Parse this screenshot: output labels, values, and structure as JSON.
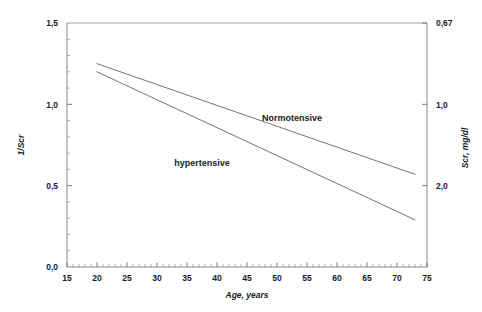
{
  "chart_data": {
    "type": "line",
    "title": "",
    "subtitle": "",
    "xlabel": "Age, years",
    "ylabel": "1/Scr",
    "ylabel_right": "Scr, mg/dl",
    "xlim": [
      15,
      75
    ],
    "ylim": [
      0.0,
      1.5
    ],
    "x_ticks": [
      15,
      20,
      25,
      30,
      35,
      40,
      45,
      50,
      55,
      60,
      65,
      70,
      75
    ],
    "x_tick_labels": [
      "15",
      "20",
      "25",
      "30",
      "35",
      "40",
      "45",
      "50",
      "55",
      "60",
      "65",
      "70",
      "75"
    ],
    "x_minor_tick_step": 1,
    "y_ticks": [
      0.0,
      0.5,
      1.0,
      1.5
    ],
    "y_tick_labels": [
      "0,0",
      "0,5",
      "1,0",
      "1,5"
    ],
    "y_right_ticks": [
      0.5,
      1.0,
      1.5
    ],
    "y_right_tick_labels": [
      "2,0",
      "1,0",
      "0,67"
    ],
    "grid": false,
    "legend": "inline-annotations",
    "legend_position": "inside-plot",
    "series": [
      {
        "name": "Normotensive",
        "label": "Normotensive",
        "label_x": 52.5,
        "label_y": 0.895,
        "x": [
          20,
          73
        ],
        "values": [
          1.25,
          0.57
        ],
        "x_start": 20,
        "x_end": 73,
        "y_start": 1.25,
        "y_end": 0.57
      },
      {
        "name": "hypertensive",
        "label": "hypertensive",
        "label_x": 37.5,
        "label_y": 0.62,
        "x": [
          20,
          73
        ],
        "values": [
          1.2,
          0.29
        ],
        "x_start": 20,
        "x_end": 73,
        "y_start": 1.2,
        "y_end": 0.29
      }
    ]
  },
  "colors": {
    "background": "#ffffff",
    "axis": "#7d7d7d",
    "frame": "#9a9a9a",
    "text": "#1a1a1a",
    "line": "#5b5b5b"
  }
}
